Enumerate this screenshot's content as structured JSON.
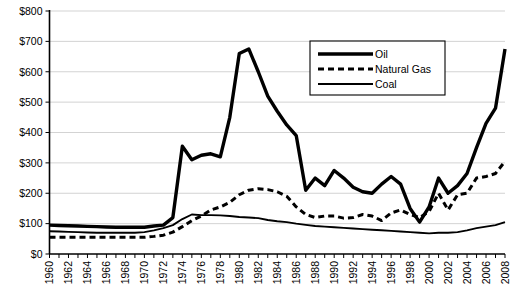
{
  "chart_data": {
    "type": "line",
    "title": "",
    "subtitle": "",
    "xlabel": "",
    "ylabel": "",
    "xlim": [
      1960,
      2008
    ],
    "ylim": [
      0,
      800
    ],
    "ytick_labels": [
      "$0",
      "$100",
      "$200",
      "$300",
      "$400",
      "$500",
      "$600",
      "$700",
      "$800"
    ],
    "ytick_values": [
      0,
      100,
      200,
      300,
      400,
      500,
      600,
      700,
      800
    ],
    "xtick_labels": [
      "1960",
      "1962",
      "1964",
      "1966",
      "1968",
      "1970",
      "1972",
      "1974",
      "1976",
      "1978",
      "1980",
      "1982",
      "1984",
      "1986",
      "1988",
      "1990",
      "1992",
      "1994",
      "1996",
      "1998",
      "2000",
      "2002",
      "2004",
      "2006",
      "2008"
    ],
    "xtick_label_rotation": -90,
    "x": [
      1960,
      1961,
      1962,
      1963,
      1964,
      1965,
      1966,
      1967,
      1968,
      1969,
      1970,
      1971,
      1972,
      1973,
      1974,
      1975,
      1976,
      1977,
      1978,
      1979,
      1980,
      1981,
      1982,
      1983,
      1984,
      1985,
      1986,
      1987,
      1988,
      1989,
      1990,
      1991,
      1992,
      1993,
      1994,
      1995,
      1996,
      1997,
      1998,
      1999,
      2000,
      2001,
      2002,
      2003,
      2004,
      2005,
      2006,
      2007,
      2008
    ],
    "grid": "horizontal",
    "legend_position": "upper-center-right",
    "series": [
      {
        "name": "Oil",
        "style": "solid-thick",
        "color": "#000000",
        "values": [
          95,
          94,
          93,
          92,
          91,
          90,
          89,
          88,
          88,
          88,
          88,
          92,
          95,
          120,
          355,
          310,
          325,
          330,
          320,
          450,
          660,
          675,
          600,
          520,
          470,
          425,
          390,
          210,
          250,
          225,
          275,
          250,
          220,
          205,
          200,
          230,
          255,
          230,
          150,
          105,
          155,
          250,
          200,
          225,
          265,
          350,
          430,
          480,
          675
        ]
      },
      {
        "name": "Natural Gas",
        "style": "dashed",
        "color": "#000000",
        "values": [
          55,
          55,
          55,
          55,
          55,
          55,
          55,
          55,
          55,
          55,
          55,
          58,
          62,
          72,
          90,
          110,
          125,
          145,
          155,
          170,
          195,
          210,
          215,
          212,
          205,
          190,
          155,
          130,
          120,
          125,
          125,
          118,
          120,
          130,
          125,
          110,
          135,
          145,
          130,
          120,
          140,
          200,
          145,
          195,
          200,
          250,
          255,
          265,
          305
        ]
      },
      {
        "name": "Coal",
        "style": "solid-thin",
        "color": "#000000",
        "values": [
          75,
          74,
          73,
          72,
          71,
          70,
          70,
          70,
          70,
          70,
          72,
          78,
          85,
          95,
          115,
          130,
          128,
          128,
          127,
          125,
          122,
          120,
          118,
          112,
          108,
          105,
          100,
          96,
          92,
          90,
          88,
          86,
          84,
          82,
          80,
          78,
          76,
          74,
          72,
          70,
          68,
          70,
          70,
          72,
          78,
          85,
          90,
          95,
          105
        ]
      }
    ]
  },
  "legend": {
    "items": [
      {
        "label": "Oil",
        "style": "solid-thick"
      },
      {
        "label": "Natural Gas",
        "style": "dashed"
      },
      {
        "label": "Coal",
        "style": "solid-thin"
      }
    ]
  }
}
